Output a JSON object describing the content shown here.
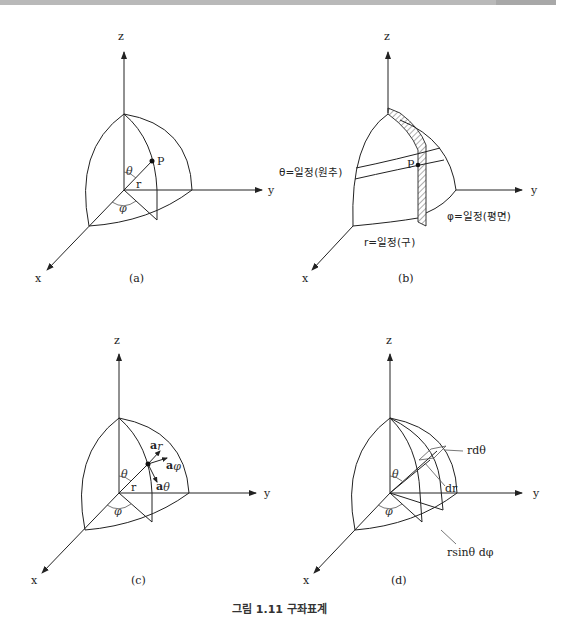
{
  "header": {
    "band_color": "#b9b9b9"
  },
  "caption": "그림 1.11 구좌표계",
  "axes": {
    "x": "x",
    "y": "y",
    "z": "z"
  },
  "figures": {
    "a": {
      "label": "(a)",
      "point": "P",
      "radius": "r",
      "theta": "θ",
      "phi": "φ"
    },
    "b": {
      "label": "(b)",
      "point": "P",
      "theta_const": "θ=일정(원추)",
      "phi_const": "φ=일정(평면)",
      "r_const": "r=일정(구)"
    },
    "c": {
      "label": "(c)",
      "radius": "r",
      "theta": "θ",
      "phi": "φ",
      "unit_r": "a",
      "unit_r_sub": "r",
      "unit_phi": "a",
      "unit_phi_sub": "φ",
      "unit_theta": "a",
      "unit_theta_sub": "θ"
    },
    "d": {
      "label": "(d)",
      "theta": "θ",
      "phi": "φ",
      "r_dtheta": "rdθ",
      "dr": "dr",
      "r_sin_dphi": "rsinθ dφ"
    }
  }
}
